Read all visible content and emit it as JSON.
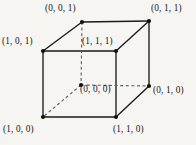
{
  "figure": {
    "kind": "unit-cube-vertex-diagram",
    "background_color": "#f6f5f2",
    "line_color": "#1a1a1a",
    "text_color": "#161616",
    "vertices": [
      {
        "id": "v001",
        "label": "(0, 0, 1)",
        "x": 82,
        "y": 22,
        "hidden": false
      },
      {
        "id": "v011",
        "label": "(0, 1, 1)",
        "x": 149,
        "y": 21,
        "hidden": false
      },
      {
        "id": "v101",
        "label": "(1, 0, 1)",
        "x": 43,
        "y": 51,
        "hidden": false
      },
      {
        "id": "v111",
        "label": "(1, 1, 1)",
        "x": 116,
        "y": 51,
        "hidden": false
      },
      {
        "id": "v000",
        "label": "(0, 0, 0)",
        "x": 81,
        "y": 85,
        "hidden": true
      },
      {
        "id": "v010",
        "label": "(0, 1, 0)",
        "x": 149,
        "y": 86,
        "hidden": false
      },
      {
        "id": "v100",
        "label": "(1, 0, 0)",
        "x": 43,
        "y": 117,
        "hidden": false
      },
      {
        "id": "v110",
        "label": "(1, 1, 0)",
        "x": 116,
        "y": 117,
        "hidden": false
      }
    ],
    "edges": [
      {
        "from": "v001",
        "to": "v011",
        "style": "solid"
      },
      {
        "from": "v001",
        "to": "v101",
        "style": "solid"
      },
      {
        "from": "v011",
        "to": "v111",
        "style": "solid"
      },
      {
        "from": "v011",
        "to": "v010",
        "style": "solid"
      },
      {
        "from": "v101",
        "to": "v111",
        "style": "solid"
      },
      {
        "from": "v101",
        "to": "v100",
        "style": "solid"
      },
      {
        "from": "v111",
        "to": "v110",
        "style": "solid"
      },
      {
        "from": "v100",
        "to": "v110",
        "style": "solid"
      },
      {
        "from": "v110",
        "to": "v010",
        "style": "solid"
      },
      {
        "from": "v001",
        "to": "v000",
        "style": "dashed"
      },
      {
        "from": "v000",
        "to": "v010",
        "style": "dashed"
      },
      {
        "from": "v000",
        "to": "v100",
        "style": "dashed"
      }
    ]
  }
}
